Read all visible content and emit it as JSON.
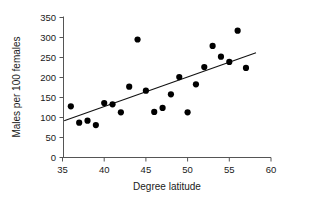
{
  "chart_data": {
    "type": "scatter",
    "title": "",
    "xlabel": "Degree latitude",
    "ylabel": "Males per 100 females",
    "xlim": [
      35,
      60
    ],
    "ylim": [
      0,
      350
    ],
    "xticks": [
      35,
      40,
      45,
      50,
      55,
      60
    ],
    "yticks": [
      0,
      50,
      100,
      150,
      200,
      250,
      300,
      350
    ],
    "grid": false,
    "legend": "none",
    "x": [
      36,
      37,
      38,
      39,
      40,
      41,
      42,
      43,
      44,
      45,
      46,
      47,
      48,
      49,
      50,
      51,
      52,
      53,
      54,
      55,
      56,
      57
    ],
    "y": [
      128,
      87,
      92,
      81,
      136,
      133,
      113,
      177,
      295,
      167,
      114,
      124,
      158,
      201,
      113,
      183,
      226,
      279,
      252,
      239,
      317,
      224
    ],
    "points": [
      {
        "x": 36,
        "y": 128
      },
      {
        "x": 37,
        "y": 87
      },
      {
        "x": 38,
        "y": 92
      },
      {
        "x": 39,
        "y": 81
      },
      {
        "x": 40,
        "y": 136
      },
      {
        "x": 41,
        "y": 133
      },
      {
        "x": 42,
        "y": 113
      },
      {
        "x": 43,
        "y": 177
      },
      {
        "x": 44,
        "y": 295
      },
      {
        "x": 45,
        "y": 167
      },
      {
        "x": 46,
        "y": 114
      },
      {
        "x": 47,
        "y": 124
      },
      {
        "x": 48,
        "y": 158
      },
      {
        "x": 49,
        "y": 201
      },
      {
        "x": 50,
        "y": 113
      },
      {
        "x": 51,
        "y": 183
      },
      {
        "x": 52,
        "y": 226
      },
      {
        "x": 53,
        "y": 279
      },
      {
        "x": 54,
        "y": 252
      },
      {
        "x": 55,
        "y": 239
      },
      {
        "x": 56,
        "y": 317
      },
      {
        "x": 57,
        "y": 224
      }
    ],
    "trendline": {
      "type": "linear-fit",
      "x_start": 35.2,
      "y_start": 92,
      "x_end": 58.2,
      "y_end": 262
    },
    "marker": {
      "shape": "circle",
      "color": "#000000",
      "size_px": 3.1
    },
    "axis_color": "#555555",
    "text_color": "#1a1a1a",
    "background": "#ffffff"
  }
}
